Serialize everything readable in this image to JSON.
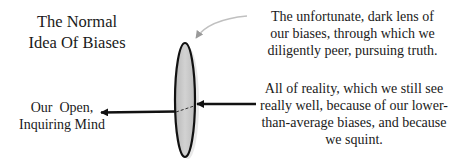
{
  "title": {
    "line1": "The Normal",
    "line2": "Idea Of Biases"
  },
  "labels": {
    "lens": {
      "line1": "The unfortunate, dark lens of",
      "line2": "our biases, through which we",
      "line3": "diligently peer, pursuing truth."
    },
    "reality": {
      "line1": "All of reality, which we still see",
      "line2": "really well, because of our lower-",
      "line3": "than-average biases, and because",
      "line4": "we squint."
    },
    "mind": {
      "line1": "Our  Open,",
      "line2": "Inquiring Mind"
    }
  },
  "colors": {
    "lens_fill": "#c8c8c8",
    "lens_stroke": "#111111",
    "arrow": "#111111",
    "pointer_arrow": "#b0b0b0",
    "text": "#1a1a1a"
  }
}
